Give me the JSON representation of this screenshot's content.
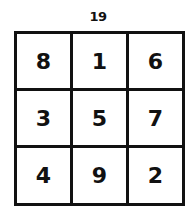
{
  "magic_sum": "19",
  "grid": {
    "rows": [
      [
        "8",
        "1",
        "6"
      ],
      [
        "3",
        "5",
        "7"
      ],
      [
        "4",
        "9",
        "2"
      ]
    ]
  },
  "colors": {
    "line": "#111111",
    "background": "#ffffff"
  }
}
